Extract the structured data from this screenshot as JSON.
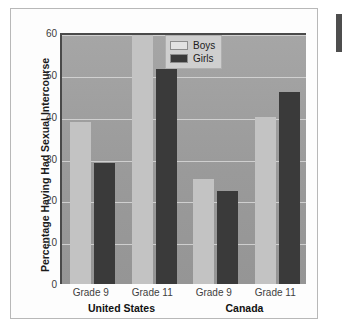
{
  "chart_data": {
    "type": "bar",
    "title": "",
    "xlabel": "",
    "ylabel": "Percentage Having Had Sexual Intercourse",
    "ylim": [
      0,
      60
    ],
    "yticks": [
      0,
      10,
      20,
      30,
      40,
      50,
      60
    ],
    "grid": true,
    "legend_position": "top-center-right",
    "categories": [
      "Grade 9",
      "Grade 11",
      "Grade 9",
      "Grade 11"
    ],
    "groups": [
      {
        "name": "United States",
        "categories": [
          "Grade 9",
          "Grade 11"
        ]
      },
      {
        "name": "Canada",
        "categories": [
          "Grade 9",
          "Grade 11"
        ]
      }
    ],
    "series": [
      {
        "name": "Boys",
        "color": "#c3c3c3",
        "values": [
          38.8,
          59.5,
          25.1,
          40.0
        ]
      },
      {
        "name": "Girls",
        "color": "#3a3a3a",
        "values": [
          29.0,
          51.5,
          22.3,
          46.0
        ]
      }
    ],
    "bars": [
      {
        "group": "United States",
        "category": "Grade 9",
        "series": "Boys",
        "value": 38.8
      },
      {
        "group": "United States",
        "category": "Grade 9",
        "series": "Girls",
        "value": 29.0
      },
      {
        "group": "United States",
        "category": "Grade 11",
        "series": "Boys",
        "value": 59.5
      },
      {
        "group": "United States",
        "category": "Grade 11",
        "series": "Girls",
        "value": 51.5
      },
      {
        "group": "Canada",
        "category": "Grade 9",
        "series": "Boys",
        "value": 25.1
      },
      {
        "group": "Canada",
        "category": "Grade 9",
        "series": "Girls",
        "value": 22.3
      },
      {
        "group": "Canada",
        "category": "Grade 11",
        "series": "Boys",
        "value": 40.0
      },
      {
        "group": "Canada",
        "category": "Grade 11",
        "series": "Girls",
        "value": 46.0
      }
    ]
  },
  "axis": {
    "y_ticks": [
      "60",
      "50",
      "40",
      "30",
      "20",
      "10",
      "0"
    ],
    "y_title": "Percentage Having Had Sexual Intercourse",
    "x_ticks": [
      "Grade 9",
      "Grade 11",
      "Grade 9",
      "Grade 11"
    ],
    "group_labels": [
      "United States",
      "Canada"
    ]
  },
  "legend": {
    "items": [
      {
        "label": "Boys",
        "color": "#c3c3c3"
      },
      {
        "label": "Girls",
        "color": "#3a3a3a"
      }
    ]
  },
  "colors": {
    "boys": "#c3c3c3",
    "girls": "#3a3a3a",
    "plot_background": "#9d9d9d",
    "gridline": "#d8d8d8",
    "axis": "#4a4a4a"
  }
}
